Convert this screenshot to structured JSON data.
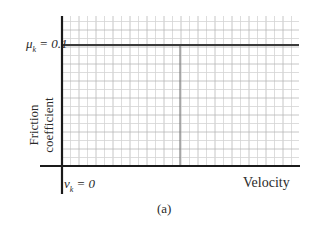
{
  "chart_data": {
    "type": "line",
    "title": "",
    "caption": "(a)",
    "xlabel": "Velocity",
    "ylabel_lines": [
      "Friction",
      "coefficient"
    ],
    "ylabel": "Friction coefficient",
    "x_tick_labels": [
      "v_k = 0"
    ],
    "y_tick_labels": [
      "μ_k = 0.1"
    ],
    "grid": true,
    "legend": null,
    "series": [
      {
        "name": "kinetic friction coefficient",
        "x": [
          0,
          1
        ],
        "y": [
          0.1,
          0.1
        ],
        "style": "solid horizontal line"
      }
    ],
    "annotations": [
      {
        "type": "vertical-line",
        "x_fraction": 0.5,
        "from_y": 0,
        "to_y": 0.1,
        "style": "thin dark"
      }
    ],
    "ylim": [
      0,
      0.12
    ],
    "xlim": [
      0,
      1
    ]
  },
  "labels": {
    "mu": "μ",
    "mu_sub": "k",
    "mu_val": " = 0.1",
    "v": "v",
    "v_sub": "k",
    "v_val": " = 0",
    "ylabel_line1": "Friction",
    "ylabel_line2": "coefficient",
    "xlabel": "Velocity",
    "caption": "(a)"
  },
  "colors": {
    "axis": "#1a1a1a",
    "grid_minor": "#d4d4d4",
    "grid_major": "#b8b8b8",
    "series": "#3a3a3a",
    "background": "#ffffff"
  }
}
